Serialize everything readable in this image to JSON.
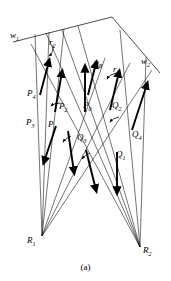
{
  "figure": {
    "caption": "(a)",
    "type": "ray-wavefront-geometry-diagram"
  },
  "labels": {
    "w1": "w",
    "w1_sub": "1",
    "w2": "w",
    "w2_sub": "2",
    "r1": "r",
    "r1_sub": "1",
    "r2": "r",
    "r2_sub": "2",
    "n0": "n",
    "n0_sub": "0",
    "P0": "P",
    "P0_sub": "0",
    "P1": "P",
    "P1_sub": "1",
    "P2": "P",
    "P2_sub": "2",
    "P3": "P",
    "P3_sub": "3",
    "P4": "P",
    "P4_sub": "4",
    "Q1": "Q",
    "Q1_sub": "1",
    "Q2": "Q",
    "Q2_sub": "2",
    "Q3": "Q",
    "Q3_sub": "3",
    "Q4": "Q",
    "Q4_sub": "4",
    "R1": "R",
    "R1_sub": "1",
    "R2": "R",
    "R2_sub": "2"
  },
  "colors": {
    "stroke": "#000000",
    "background": "#ffffff"
  }
}
